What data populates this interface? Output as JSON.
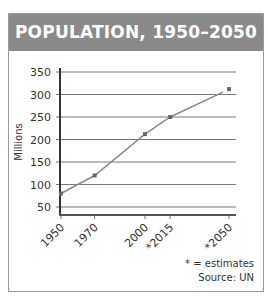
{
  "header": {
    "title": "POPULATION, 1950–2050"
  },
  "chart_data": {
    "type": "line",
    "title": "POPULATION, 1950–2050",
    "xlabel": "",
    "ylabel": "Millions",
    "categories": [
      "1950",
      "1970",
      "2000",
      "*2015",
      "*2050"
    ],
    "x": [
      1950,
      1970,
      2000,
      2015,
      2050
    ],
    "series": [
      {
        "name": "Population",
        "values": [
          80,
          120,
          212,
          250,
          312
        ]
      }
    ],
    "yticks": [
      50,
      100,
      150,
      200,
      250,
      300,
      350
    ],
    "ylim": [
      35,
      350
    ],
    "grid": true,
    "legend": "none",
    "colors": {
      "header": "#8a8a8a",
      "line": "#8a8a8a",
      "marker": "#666666",
      "grid": "#777777"
    }
  },
  "notes": {
    "estimates": "* = estimates",
    "source": "Source: UN"
  }
}
